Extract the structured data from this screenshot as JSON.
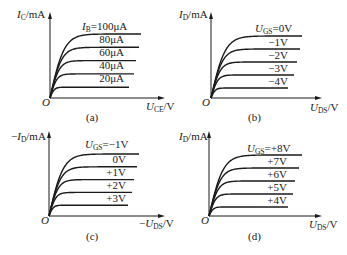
{
  "figure": {
    "panels": [
      {
        "id": "a",
        "caption": "(a)",
        "y_axis": {
          "prefix": "",
          "var": "I",
          "sub": "C",
          "unit": "/mA"
        },
        "x_axis": {
          "prefix": "",
          "var": "U",
          "sub": "CE",
          "unit": "/V"
        },
        "origin": "O",
        "param": {
          "var": "I",
          "sub": "B",
          "eq": "="
        },
        "curve_labels": [
          "100μA",
          "80μA",
          "60μA",
          "40μA",
          "20μA"
        ]
      },
      {
        "id": "b",
        "caption": "(b)",
        "y_axis": {
          "prefix": "",
          "var": "I",
          "sub": "D",
          "unit": "/mA"
        },
        "x_axis": {
          "prefix": "",
          "var": "U",
          "sub": "DS",
          "unit": "/V"
        },
        "origin": "O",
        "param": {
          "var": "U",
          "sub": "GS",
          "eq": "="
        },
        "curve_labels": [
          "0V",
          "−1V",
          "−2V",
          "−3V",
          "−4V"
        ]
      },
      {
        "id": "c",
        "caption": "(c)",
        "y_axis": {
          "prefix": "−",
          "var": "I",
          "sub": "D",
          "unit": "/mA"
        },
        "x_axis": {
          "prefix": "−",
          "var": "U",
          "sub": "DS",
          "unit": "/V"
        },
        "origin": "O",
        "param": {
          "var": "U",
          "sub": "GS",
          "eq": "="
        },
        "curve_labels": [
          "−1V",
          "0V",
          "+1V",
          "+2V",
          "+3V"
        ]
      },
      {
        "id": "d",
        "caption": "(d)",
        "y_axis": {
          "prefix": "",
          "var": "I",
          "sub": "D",
          "unit": "/mA"
        },
        "x_axis": {
          "prefix": "",
          "var": "U",
          "sub": "DS",
          "unit": "/V"
        },
        "origin": "O",
        "param": {
          "var": "U",
          "sub": "GS",
          "eq": "="
        },
        "curve_labels": [
          "+8V",
          "+7V",
          "+6V",
          "+5V",
          "+4V"
        ]
      }
    ]
  },
  "chart_data": [
    {
      "type": "line",
      "title": "(a)",
      "xlabel": "U_CE/V",
      "ylabel": "I_C/mA",
      "grid": false,
      "series": [
        {
          "name": "I_B=100μA",
          "saturation_level": 5
        },
        {
          "name": "80μA",
          "saturation_level": 4
        },
        {
          "name": "60μA",
          "saturation_level": 3
        },
        {
          "name": "40μA",
          "saturation_level": 2
        },
        {
          "name": "20μA",
          "saturation_level": 1
        }
      ]
    },
    {
      "type": "line",
      "title": "(b)",
      "xlabel": "U_DS/V",
      "ylabel": "I_D/mA",
      "grid": false,
      "series": [
        {
          "name": "U_GS=0V",
          "saturation_level": 5
        },
        {
          "name": "−1V",
          "saturation_level": 4
        },
        {
          "name": "−2V",
          "saturation_level": 3
        },
        {
          "name": "−3V",
          "saturation_level": 2
        },
        {
          "name": "−4V",
          "saturation_level": 1
        }
      ]
    },
    {
      "type": "line",
      "title": "(c)",
      "xlabel": "−U_DS/V",
      "ylabel": "−I_D/mA",
      "grid": false,
      "series": [
        {
          "name": "U_GS=−1V",
          "saturation_level": 5
        },
        {
          "name": "0V",
          "saturation_level": 4
        },
        {
          "name": "+1V",
          "saturation_level": 3
        },
        {
          "name": "+2V",
          "saturation_level": 2
        },
        {
          "name": "+3V",
          "saturation_level": 1
        }
      ]
    },
    {
      "type": "line",
      "title": "(d)",
      "xlabel": "U_DS/V",
      "ylabel": "I_D/mA",
      "grid": false,
      "series": [
        {
          "name": "U_GS=+8V",
          "saturation_level": 5
        },
        {
          "name": "+7V",
          "saturation_level": 4
        },
        {
          "name": "+6V",
          "saturation_level": 3
        },
        {
          "name": "+5V",
          "saturation_level": 2
        },
        {
          "name": "+4V",
          "saturation_level": 1
        }
      ]
    }
  ]
}
